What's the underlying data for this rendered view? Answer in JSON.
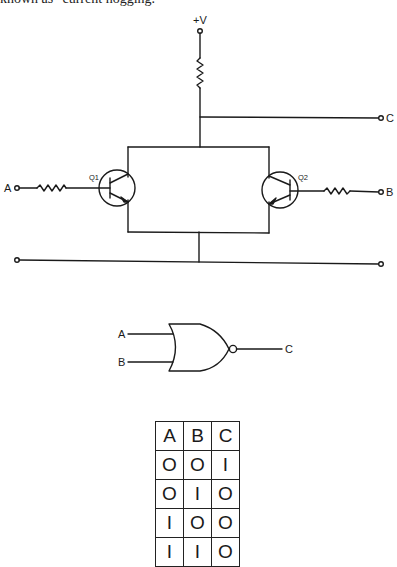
{
  "caption": "known as \"current hogging.\"",
  "circuit": {
    "supply_label": "+V",
    "output_label": "C",
    "input_a_label": "A",
    "input_b_label": "B",
    "transistor_1_label": "Q1",
    "transistor_2_label": "Q2"
  },
  "gate": {
    "type": "NOR",
    "input_a_label": "A",
    "input_b_label": "B",
    "output_label": "C"
  },
  "truth_table": {
    "headers": [
      "A",
      "B",
      "C"
    ],
    "rows": [
      [
        "O",
        "O",
        "I"
      ],
      [
        "O",
        "I",
        "O"
      ],
      [
        "I",
        "O",
        "O"
      ],
      [
        "I",
        "I",
        "O"
      ]
    ]
  }
}
